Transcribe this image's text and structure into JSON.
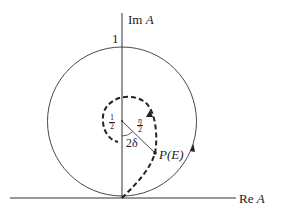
{
  "diagram": {
    "type": "argand-diagram",
    "axes": {
      "imaginary_label_prefix": "Im",
      "imaginary_label_var": "A",
      "real_label_prefix": "Re",
      "real_label_var": "A"
    },
    "unit_circle_top_label": "1",
    "inner_center_label": {
      "num": "1",
      "den": "2"
    },
    "radius_label": {
      "num": "η",
      "den": "2"
    },
    "angle_label": "2δ",
    "point_label": "P(E)",
    "colors": {
      "ink": "#222222",
      "background": "#ffffff"
    }
  }
}
